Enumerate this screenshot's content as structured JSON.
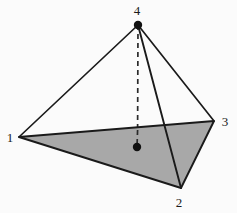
{
  "figure": {
    "canvas": {
      "width": 237,
      "height": 213
    },
    "colors": {
      "background": "#fbfbfb",
      "base_fill": "#a8a8a8",
      "edge_stroke": "#1a1a1a",
      "dashed_stroke": "#2a2a2a",
      "point_fill": "#111111",
      "label_color": "#1a1a1a"
    },
    "vertices": [
      {
        "id": "1",
        "label": "1",
        "x": 19,
        "y": 137,
        "label_x": 10,
        "label_y": 142,
        "dot": false
      },
      {
        "id": "2",
        "label": "2",
        "x": 181,
        "y": 188,
        "label_x": 176,
        "label_y": 207,
        "dot": false
      },
      {
        "id": "3",
        "label": "3",
        "x": 214,
        "y": 121,
        "label_x": 221,
        "label_y": 126,
        "dot": false
      },
      {
        "id": "4",
        "label": "4",
        "x": 138,
        "y": 25,
        "label_x": 133,
        "label_y": 15,
        "dot": true
      }
    ],
    "centroid": {
      "label": "",
      "x": 137,
      "y": 147,
      "dot": true,
      "radius": 4
    },
    "base_face": {
      "name": "base-triangle-123",
      "points": "19,137 181,188 214,121",
      "filled": true
    },
    "edges": [
      {
        "name": "edge-4-1",
        "from": "4",
        "to": "1",
        "style": "solid"
      },
      {
        "name": "edge-4-3",
        "from": "4",
        "to": "3",
        "style": "solid"
      },
      {
        "name": "edge-4-2",
        "from": "4",
        "to": "2",
        "style": "solid"
      },
      {
        "name": "edge-1-3",
        "from": "1",
        "to": "3",
        "style": "solid"
      },
      {
        "name": "edge-1-2",
        "from": "1",
        "to": "2",
        "style": "solid"
      },
      {
        "name": "edge-2-3",
        "from": "2",
        "to": "3",
        "style": "solid"
      }
    ],
    "altitude": {
      "name": "altitude-4-centroid",
      "from": "4",
      "to": "centroid",
      "style": "dashed",
      "dash_pattern": "5 4"
    }
  }
}
